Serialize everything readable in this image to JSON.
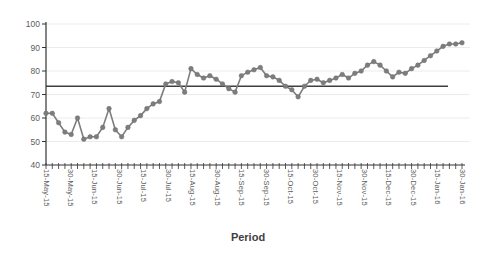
{
  "chart_data": {
    "type": "line",
    "title": "",
    "xlabel": "Period",
    "ylabel": "",
    "ylim": [
      40,
      100
    ],
    "yticks": [
      40,
      50,
      60,
      70,
      80,
      90,
      100
    ],
    "x_tick_labels": [
      "15-May-15",
      "30-May-15",
      "15-Jun-15",
      "30-Jun-15",
      "15-Jul-15",
      "30-Jul-15",
      "15-Aug-15",
      "30-Aug-15",
      "15-Sep-15",
      "30-Sep-15",
      "15-Oct-15",
      "30-Oct-15",
      "15-Nov-15",
      "30-Nov-15",
      "15-Dec-15",
      "30-Dec-15",
      "15-Jan-16",
      "30-Jan-16"
    ],
    "grid": "faint-horizontal",
    "legend_position": "none",
    "series": [
      {
        "name": "observations",
        "marker": "circle",
        "color": "#7d7d7d",
        "values": [
          62,
          62,
          58,
          54,
          53,
          60,
          51,
          52,
          52,
          56,
          64,
          55,
          52,
          56,
          59,
          61,
          64,
          66,
          67,
          74.5,
          75.5,
          75,
          71,
          81,
          78.5,
          77,
          78,
          76.5,
          74.5,
          72.5,
          71,
          78,
          79.5,
          80.5,
          81.5,
          78,
          77.5,
          76,
          73.5,
          72,
          69,
          73.5,
          76,
          76.5,
          75,
          76,
          77,
          78.5,
          77,
          79,
          80,
          82.5,
          84,
          82.5,
          80,
          77.5,
          79.5,
          79,
          81,
          82.5,
          84.5,
          86.5,
          88.5,
          90.5,
          91.5,
          91.5,
          92
        ]
      }
    ],
    "reference_line": {
      "value": 73.5,
      "color": "#3f3f3f"
    }
  },
  "style_colors": {
    "axis": "#333333",
    "tick": "#333333",
    "gridline": "#ececec",
    "tick_label": "#5d5d5d",
    "axis_title": "#3f3f3f"
  }
}
